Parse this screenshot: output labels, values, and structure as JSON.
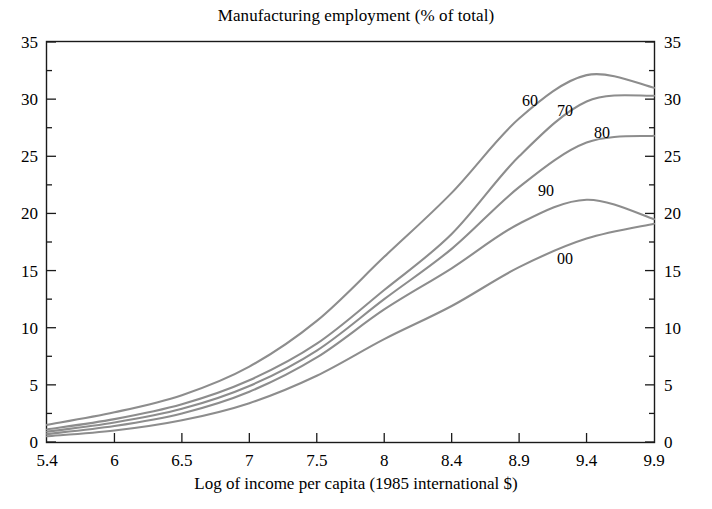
{
  "chart_data": {
    "type": "line",
    "title": "Manufacturing employment (% of total)",
    "xlabel": "Log of income per capita (1985 international $)",
    "ylabel": "",
    "grid": false,
    "legend_position": "inline-curve-labels",
    "xtick_labels": [
      "5.4",
      "6",
      "6.5",
      "7",
      "7.5",
      "8",
      "8.4",
      "8.9",
      "9.4",
      "9.9"
    ],
    "xtick_values": [
      5.4,
      6,
      6.5,
      7,
      7.5,
      8,
      8.4,
      8.9,
      9.4,
      9.9
    ],
    "ytick_labels": [
      "0",
      "5",
      "10",
      "15",
      "20",
      "25",
      "30",
      "35"
    ],
    "ylim": [
      0,
      35
    ],
    "ytick_step": 5,
    "yminor_step": 2.5,
    "right_axis_ytick_labels": [
      "0",
      "5",
      "10",
      "15",
      "20",
      "25",
      "30",
      "35"
    ],
    "x": [
      5.4,
      6,
      6.5,
      7,
      7.5,
      8,
      8.4,
      8.9,
      9.4,
      9.9
    ],
    "series": [
      {
        "name": "60",
        "label": "60",
        "color": "#8d8d8d",
        "values": [
          1.5,
          2.6,
          4.1,
          6.6,
          10.6,
          16.2,
          21.8,
          28.3,
          32.1,
          31.0
        ]
      },
      {
        "name": "70",
        "label": "70",
        "color": "#8d8d8d",
        "values": [
          1.1,
          2.0,
          3.3,
          5.4,
          8.6,
          13.3,
          18.2,
          25.0,
          29.8,
          30.3
        ]
      },
      {
        "name": "80",
        "label": "80",
        "color": "#8d8d8d",
        "values": [
          0.9,
          1.7,
          2.9,
          4.9,
          8.0,
          12.5,
          16.9,
          22.3,
          26.2,
          26.8
        ]
      },
      {
        "name": "90",
        "label": "90",
        "color": "#8d8d8d",
        "values": [
          0.7,
          1.4,
          2.5,
          4.4,
          7.4,
          11.6,
          15.2,
          19.1,
          21.2,
          19.5
        ]
      },
      {
        "name": "00",
        "label": "00",
        "color": "#8d8d8d",
        "values": [
          0.5,
          1.0,
          1.9,
          3.4,
          5.8,
          9.0,
          11.9,
          15.3,
          17.8,
          19.1
        ]
      }
    ],
    "annotations": [
      {
        "text": "60",
        "x_px": 530,
        "y_px": 106
      },
      {
        "text": "70",
        "x_px": 565,
        "y_px": 116
      },
      {
        "text": "80",
        "x_px": 602,
        "y_px": 138
      },
      {
        "text": "90",
        "x_px": 546,
        "y_px": 196
      },
      {
        "text": "00",
        "x_px": 565,
        "y_px": 264
      }
    ]
  }
}
